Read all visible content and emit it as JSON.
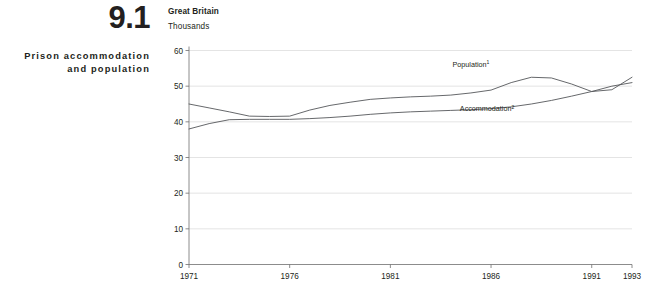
{
  "panel": {
    "number": "9.1",
    "title": "Prison accommodation\nand population",
    "title_line1": "Prison accommodation",
    "title_line2": "and population"
  },
  "chart_header": {
    "geography": "Great Britain",
    "units": "Thousands"
  },
  "colors": {
    "line": "#55575a",
    "grid": "#d9d9d9",
    "axis": "#6e6e6e",
    "text": "#231f20"
  },
  "chart_data": {
    "type": "line",
    "title": "Prison accommodation and population",
    "subtitle": "Great Britain",
    "xlabel": "",
    "ylabel": "Thousands",
    "ylim": [
      0,
      60
    ],
    "xlim": [
      1971,
      1993
    ],
    "yticks": [
      0,
      10,
      20,
      30,
      40,
      50,
      60
    ],
    "ytick_labels": [
      "0",
      "10",
      "20",
      "30",
      "40",
      "50",
      "60"
    ],
    "xticks": [
      1971,
      1976,
      1981,
      1986,
      1991,
      1993
    ],
    "xtick_labels": [
      "1971",
      "1976",
      "1981",
      "1986",
      "1991",
      "1993"
    ],
    "grid": true,
    "legend": "inline-annotations",
    "x": [
      1971,
      1972,
      1973,
      1974,
      1975,
      1976,
      1977,
      1978,
      1979,
      1980,
      1981,
      1982,
      1983,
      1984,
      1985,
      1986,
      1987,
      1988,
      1989,
      1990,
      1991,
      1992,
      1993
    ],
    "series": [
      {
        "name": "Population",
        "footnote_marker": "1",
        "label": "Population",
        "label_x": 1985.0,
        "label_y": 55.5,
        "values": [
          45.0,
          43.9,
          42.8,
          41.6,
          41.5,
          41.6,
          43.3,
          44.6,
          45.5,
          46.3,
          46.7,
          47.0,
          47.2,
          47.5,
          48.1,
          48.9,
          51.0,
          52.5,
          52.3,
          50.6,
          48.5,
          49.0,
          52.5
        ]
      },
      {
        "name": "Accommodation",
        "footnote_marker": "2",
        "label": "Accommodation",
        "label_x": 1985.8,
        "label_y": 43.0,
        "values": [
          38.0,
          39.5,
          40.6,
          40.7,
          40.7,
          40.7,
          40.9,
          41.2,
          41.6,
          42.1,
          42.5,
          42.8,
          43.0,
          43.2,
          43.4,
          43.7,
          44.2,
          45.0,
          46.0,
          47.2,
          48.5,
          50.0,
          51.0
        ]
      }
    ]
  }
}
